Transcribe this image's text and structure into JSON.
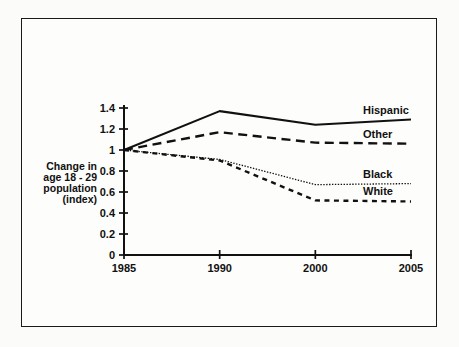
{
  "chart_data": {
    "type": "line",
    "title": "",
    "xlabel": "",
    "ylabel": "Change in age 18 - 29 population (index)",
    "categories": [
      "1985",
      "1990",
      "2000",
      "2005"
    ],
    "x": [
      1985,
      1990,
      2000,
      2005
    ],
    "xtick_labels": [
      "1985",
      "1990",
      "2000",
      "2005"
    ],
    "ytick_labels": [
      "0",
      "0.2",
      "0.4",
      "0.6",
      "0.8",
      "1",
      "1.2",
      "1.4"
    ],
    "ytick_values": [
      0,
      0.2,
      0.4,
      0.6,
      0.8,
      1,
      1.2,
      1.4
    ],
    "ylim": [
      0,
      1.4
    ],
    "grid": false,
    "legend_position": "right-of-line-ends",
    "series": [
      {
        "name": "Hispanic",
        "style": "solid",
        "values": [
          1.0,
          1.37,
          1.24,
          1.29
        ]
      },
      {
        "name": "Other",
        "style": "long-dash",
        "values": [
          1.0,
          1.17,
          1.07,
          1.06
        ]
      },
      {
        "name": "Black",
        "style": "dotted",
        "values": [
          1.0,
          0.91,
          0.67,
          0.68
        ]
      },
      {
        "name": "White",
        "style": "short-dash",
        "values": [
          1.0,
          0.9,
          0.52,
          0.51
        ]
      }
    ]
  },
  "axis": {
    "y_label_lines": [
      "Change in",
      "age 18 - 29",
      "population",
      "(index)"
    ]
  }
}
